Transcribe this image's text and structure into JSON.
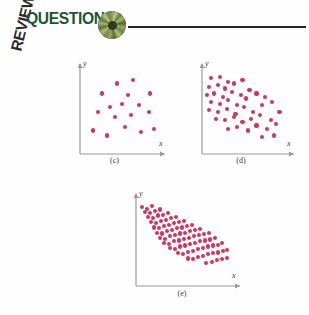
{
  "header": {
    "review_label": "REVIEW",
    "questions_label": "QUESTIONS",
    "disc_icon": "green-radial-disc-icon",
    "rule": "horizontal-rule"
  },
  "colors": {
    "point": "#d6335c",
    "axis": "#9a9a9a",
    "heading_green": "#1d5632",
    "heading_dark": "#2b2b2b",
    "rule": "#262626"
  },
  "chart_data": [
    {
      "type": "scatter",
      "id": "c",
      "caption": "(c)",
      "title": "",
      "xlabel": "x",
      "ylabel": "y",
      "xlim": [
        0,
        100
      ],
      "ylim": [
        0,
        100
      ],
      "grid": false,
      "legend": "none",
      "relationship": "no correlation",
      "n_points": 17,
      "points": [
        [
          46,
          84
        ],
        [
          66,
          88
        ],
        [
          28,
          72
        ],
        [
          60,
          70
        ],
        [
          88,
          72
        ],
        [
          38,
          56
        ],
        [
          52,
          60
        ],
        [
          74,
          58
        ],
        [
          22,
          50
        ],
        [
          44,
          44
        ],
        [
          64,
          46
        ],
        [
          86,
          50
        ],
        [
          16,
          28
        ],
        [
          34,
          22
        ],
        [
          56,
          32
        ],
        [
          76,
          26
        ],
        [
          92,
          30
        ]
      ]
    },
    {
      "type": "scatter",
      "id": "d",
      "caption": "(d)",
      "title": "",
      "xlabel": "x",
      "ylabel": "y",
      "xlim": [
        0,
        100
      ],
      "ylim": [
        0,
        100
      ],
      "grid": false,
      "legend": "none",
      "relationship": "moderate negative correlation",
      "n_points": 45,
      "points": [
        [
          10,
          90
        ],
        [
          20,
          92
        ],
        [
          30,
          86
        ],
        [
          8,
          80
        ],
        [
          18,
          82
        ],
        [
          26,
          78
        ],
        [
          36,
          84
        ],
        [
          46,
          88
        ],
        [
          6,
          70
        ],
        [
          14,
          72
        ],
        [
          24,
          68
        ],
        [
          34,
          74
        ],
        [
          44,
          70
        ],
        [
          54,
          76
        ],
        [
          10,
          62
        ],
        [
          20,
          60
        ],
        [
          30,
          64
        ],
        [
          40,
          58
        ],
        [
          50,
          66
        ],
        [
          62,
          72
        ],
        [
          72,
          68
        ],
        [
          8,
          52
        ],
        [
          18,
          50
        ],
        [
          28,
          54
        ],
        [
          38,
          48
        ],
        [
          48,
          56
        ],
        [
          58,
          50
        ],
        [
          68,
          58
        ],
        [
          80,
          62
        ],
        [
          16,
          42
        ],
        [
          26,
          40
        ],
        [
          36,
          44
        ],
        [
          46,
          38
        ],
        [
          56,
          42
        ],
        [
          66,
          46
        ],
        [
          78,
          40
        ],
        [
          88,
          50
        ],
        [
          30,
          30
        ],
        [
          40,
          32
        ],
        [
          52,
          28
        ],
        [
          62,
          34
        ],
        [
          74,
          30
        ],
        [
          84,
          36
        ],
        [
          68,
          20
        ],
        [
          82,
          22
        ]
      ]
    },
    {
      "type": "scatter",
      "id": "e",
      "caption": "(e)",
      "title": "",
      "xlabel": "x",
      "ylabel": "y",
      "xlim": [
        0,
        100
      ],
      "ylim": [
        0,
        100
      ],
      "grid": false,
      "legend": "none",
      "relationship": "strong negative correlation",
      "n_points": 86,
      "points": [
        [
          6,
          92
        ],
        [
          11,
          90
        ],
        [
          16,
          93
        ],
        [
          9,
          86
        ],
        [
          14,
          85
        ],
        [
          19,
          87
        ],
        [
          24,
          89
        ],
        [
          12,
          80
        ],
        [
          17,
          79
        ],
        [
          22,
          82
        ],
        [
          27,
          83
        ],
        [
          32,
          85
        ],
        [
          15,
          74
        ],
        [
          20,
          73
        ],
        [
          25,
          76
        ],
        [
          30,
          77
        ],
        [
          35,
          79
        ],
        [
          40,
          80
        ],
        [
          18,
          68
        ],
        [
          23,
          67
        ],
        [
          28,
          70
        ],
        [
          33,
          71
        ],
        [
          38,
          73
        ],
        [
          43,
          74
        ],
        [
          48,
          76
        ],
        [
          21,
          62
        ],
        [
          26,
          61
        ],
        [
          31,
          64
        ],
        [
          36,
          65
        ],
        [
          41,
          67
        ],
        [
          46,
          68
        ],
        [
          51,
          70
        ],
        [
          56,
          71
        ],
        [
          24,
          56
        ],
        [
          29,
          55
        ],
        [
          34,
          58
        ],
        [
          39,
          59
        ],
        [
          44,
          61
        ],
        [
          49,
          62
        ],
        [
          54,
          64
        ],
        [
          59,
          65
        ],
        [
          64,
          66
        ],
        [
          28,
          50
        ],
        [
          33,
          49
        ],
        [
          38,
          52
        ],
        [
          43,
          53
        ],
        [
          48,
          55
        ],
        [
          53,
          56
        ],
        [
          58,
          58
        ],
        [
          63,
          59
        ],
        [
          68,
          60
        ],
        [
          73,
          62
        ],
        [
          34,
          44
        ],
        [
          39,
          43
        ],
        [
          44,
          46
        ],
        [
          49,
          47
        ],
        [
          54,
          49
        ],
        [
          59,
          50
        ],
        [
          64,
          52
        ],
        [
          69,
          53
        ],
        [
          74,
          54
        ],
        [
          79,
          56
        ],
        [
          42,
          38
        ],
        [
          47,
          37
        ],
        [
          52,
          40
        ],
        [
          57,
          41
        ],
        [
          62,
          43
        ],
        [
          67,
          44
        ],
        [
          72,
          46
        ],
        [
          77,
          47
        ],
        [
          82,
          48
        ],
        [
          86,
          50
        ],
        [
          52,
          32
        ],
        [
          57,
          31
        ],
        [
          62,
          34
        ],
        [
          67,
          35
        ],
        [
          72,
          37
        ],
        [
          77,
          38
        ],
        [
          82,
          39
        ],
        [
          87,
          41
        ],
        [
          91,
          42
        ],
        [
          70,
          27
        ],
        [
          76,
          28
        ],
        [
          81,
          30
        ],
        [
          86,
          31
        ],
        [
          91,
          33
        ]
      ]
    }
  ]
}
